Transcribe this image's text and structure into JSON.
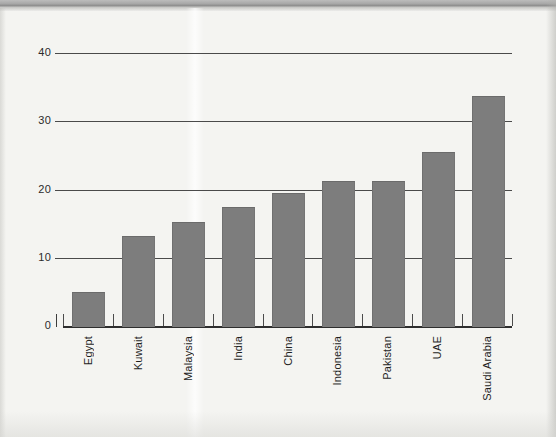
{
  "page": {
    "background_color": "#f4f4f1",
    "scan_band_color": "#a8a8a8"
  },
  "chart_data": {
    "type": "bar",
    "title": "",
    "subtitle": "",
    "xlabel": "",
    "ylabel": "",
    "categories": [
      "Egypt",
      "Kuwait",
      "Malaysia",
      "India",
      "China",
      "Indonesia",
      "Pakistan",
      "UAE",
      "Saudi Arabia"
    ],
    "values": [
      5.0,
      13.2,
      15.3,
      17.5,
      19.5,
      21.3,
      21.3,
      25.5,
      33.7
    ],
    "ylim": [
      0,
      40
    ],
    "y_ticks": [
      0,
      10,
      20,
      30,
      40
    ],
    "y_tick_labels": [
      "0",
      "10",
      "20",
      "30",
      "40"
    ],
    "grid": "horizontal",
    "legend": "none",
    "bar_color": "#7d7d7d",
    "axis_color": "#2e2e2e",
    "gridline_color": "#4a4a4a",
    "label_rotation": 90,
    "annotations": []
  }
}
